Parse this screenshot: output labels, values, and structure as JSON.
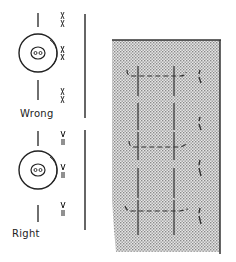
{
  "figure": {
    "type": "instructional-diagram",
    "colors": {
      "ink": "#222222",
      "fabric_shade": "#c8c8c8",
      "background": "#ffffff"
    }
  },
  "panels": {
    "wrong": {
      "label": "Wrong",
      "button_holes": 2,
      "stitch_marks": 3
    },
    "right": {
      "label": "Right",
      "button_holes": 2,
      "stitch_marks": 3
    },
    "fabric": {
      "buttonholes": 3,
      "thread_marks": 4
    }
  }
}
